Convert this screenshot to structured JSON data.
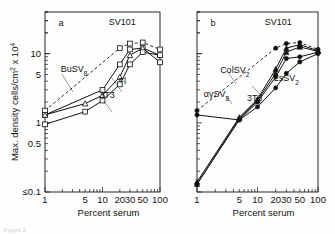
{
  "figure": {
    "background": "#fdfdfd",
    "ink": "#111111",
    "caption_faint": "Figure 2"
  },
  "axes": {
    "xlabel": "Percent serum",
    "ylabel_main": "Max. density",
    "ylabel_num": "cells",
    "ylabel_den": "cm",
    "ylabel_den_sup": "2",
    "ylabel_mult": "x 10",
    "ylabel_mult_sup": "4",
    "x_ticks_labeled": [
      "1",
      "5",
      "10",
      "20",
      "30",
      "50",
      "100"
    ],
    "x_tick_values": [
      1,
      5,
      10,
      20,
      30,
      50,
      100
    ],
    "y_ticks_labeled": [
      "10",
      "5",
      "1",
      "0.5",
      "0.1"
    ],
    "y_tick_values": [
      10,
      5,
      1,
      0.5,
      0.1
    ],
    "y_lowest_prefix": "≤",
    "xlim": [
      1,
      100
    ],
    "ylim": [
      0.1,
      40
    ],
    "xscale": "log",
    "yscale": "log",
    "grid": false
  },
  "panels": [
    {
      "id": "a",
      "label": "a"
    },
    {
      "id": "b",
      "label": "b"
    }
  ],
  "chart_data": {
    "type": "line",
    "title": "",
    "xlabel": "Percent serum",
    "ylabel": "Max. density cells/cm² x 10⁴",
    "xscale": "log",
    "yscale": "log",
    "xlim": [
      1,
      100
    ],
    "ylim": [
      0.1,
      40
    ],
    "x_ticks": [
      1,
      5,
      10,
      20,
      30,
      50,
      100
    ],
    "y_ticks": [
      10,
      5,
      1,
      0.5,
      0.1
    ],
    "grid": false,
    "legend_position": "inline-annotations",
    "panels": [
      {
        "panel": "a",
        "label": "a",
        "series": [
          {
            "name": "SV101",
            "label": "SV101",
            "style": "dashed",
            "marker": "open-square",
            "x": [
              1,
              20,
              30,
              50,
              100
            ],
            "y": [
              1.5,
              12.0,
              14.0,
              14.5,
              11.5
            ],
            "label_x": 22,
            "label_y": 26
          },
          {
            "name": "BuSV8",
            "label": "BuSV",
            "label_sub": "8",
            "style": "solid",
            "marker": "open-square",
            "x": [
              1,
              10,
              20,
              30,
              50,
              100
            ],
            "y": [
              1.3,
              3.0,
              7.0,
              11.5,
              12.0,
              7.5
            ],
            "label_x": 3.2,
            "label_y": 5.5
          },
          {
            "name": "Fl",
            "label": "Fl",
            "style": "solid",
            "marker": "open-triangle",
            "x": [
              1,
              5,
              10,
              20,
              30,
              50,
              100
            ],
            "y": [
              1.3,
              1.9,
              2.5,
              4.6,
              9.5,
              12.0,
              9.5
            ],
            "label_x": 22,
            "label_y": 3.6
          },
          {
            "name": "3T3",
            "label": "3T3",
            "style": "solid",
            "marker": "open-square",
            "x": [
              1,
              5,
              10,
              20,
              30,
              50,
              100
            ],
            "y": [
              0.95,
              1.45,
              2.1,
              3.6,
              7.0,
              10.5,
              9.5
            ],
            "label_x": 12,
            "label_y": 2.3
          }
        ]
      },
      {
        "panel": "b",
        "label": "b",
        "series": [
          {
            "name": "SV101",
            "label": "SV101",
            "style": "dashed",
            "marker": "filled-circle",
            "x": [
              1,
              20,
              30,
              50,
              100
            ],
            "y": [
              1.5,
              12.0,
              14.0,
              14.5,
              11.5
            ],
            "label_x": 22,
            "label_y": 26
          },
          {
            "name": "ColSV2",
            "label": "ColSV",
            "label_sub": "2",
            "style": "solid",
            "marker": "filled-triangle",
            "x": [
              1,
              5,
              10,
              20,
              30,
              50,
              100
            ],
            "y": [
              0.14,
              1.2,
              2.2,
              6.0,
              12.0,
              13.5,
              11.0
            ],
            "label_x": 4.2,
            "label_y": 5.2
          },
          {
            "name": "LsSV2",
            "label": "LsSV",
            "label_sub": "2",
            "style": "solid",
            "marker": "filled-circle",
            "x": [
              1,
              5,
              10,
              20,
              30,
              50,
              100
            ],
            "y": [
              0.13,
              1.1,
              2.0,
              4.6,
              8.5,
              9.0,
              10.5
            ],
            "label_x": 30,
            "label_y": 4.0
          },
          {
            "name": "agSV8",
            "label": "αγSV",
            "label_sub": "8",
            "style": "solid",
            "marker": "filled-triangle",
            "x": [
              1,
              5,
              10,
              20,
              30,
              50,
              100
            ],
            "y": [
              0.13,
              1.15,
              2.1,
              5.2,
              10.5,
              12.5,
              10.8
            ],
            "label_x": 2.1,
            "label_y": 2.4
          },
          {
            "name": "3T3",
            "label": "3T3",
            "style": "solid",
            "marker": "filled-circle",
            "x": [
              1,
              5,
              10,
              20,
              30,
              50,
              100
            ],
            "y": [
              1.3,
              1.1,
              1.7,
              3.2,
              5.2,
              7.6,
              10.0
            ],
            "label_x": 9,
            "label_y": 2.1
          }
        ]
      }
    ]
  }
}
